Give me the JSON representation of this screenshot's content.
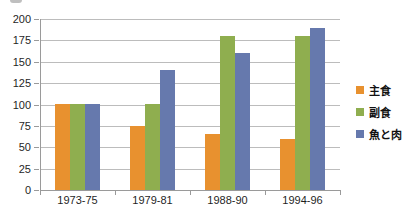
{
  "chart_data": {
    "type": "bar",
    "title": "",
    "xlabel": "",
    "ylabel": "",
    "categories": [
      "1973-75",
      "1979-81",
      "1988-90",
      "1994-96"
    ],
    "series": [
      {
        "name": "主食",
        "color": "#E8912F",
        "values": [
          100,
          75,
          65,
          60
        ]
      },
      {
        "name": "副食",
        "color": "#8FAE4F",
        "values": [
          100,
          100,
          180,
          180
        ]
      },
      {
        "name": "魚と肉",
        "color": "#6679AD",
        "values": [
          100,
          140,
          160,
          190
        ]
      }
    ],
    "ylim": [
      0,
      200
    ],
    "ytick_step": 25,
    "ytick_labels": [
      "0",
      "25",
      "50",
      "75",
      "100",
      "125",
      "150",
      "175",
      "200"
    ],
    "grid": true,
    "legend_position": "right"
  },
  "colors": {
    "gridline": "#bcbcbc",
    "axis": "#9a9a9a",
    "text": "#1f1f1f",
    "background": "#ffffff"
  }
}
